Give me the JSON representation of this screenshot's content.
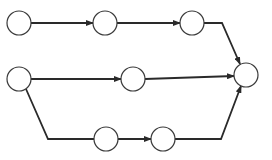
{
  "diagram": {
    "type": "network-graph",
    "colors": {
      "background": "#ffffff",
      "stroke": "#2a2a2a",
      "node_fill": "#ffffff"
    },
    "node_radius": 12,
    "nodes": [
      {
        "id": "n1",
        "x": 19,
        "y": 23
      },
      {
        "id": "n2",
        "x": 105,
        "y": 23
      },
      {
        "id": "n3",
        "x": 192,
        "y": 23
      },
      {
        "id": "n4",
        "x": 19,
        "y": 79
      },
      {
        "id": "n5",
        "x": 133,
        "y": 79
      },
      {
        "id": "n6",
        "x": 246,
        "y": 75
      },
      {
        "id": "n7",
        "x": 106,
        "y": 139
      },
      {
        "id": "n8",
        "x": 163,
        "y": 139
      }
    ],
    "edges": [
      {
        "from": "n1",
        "to": "n2",
        "path": "M31,23 L93,23",
        "arrow": true
      },
      {
        "from": "n2",
        "to": "n3",
        "path": "M117,23 L180,23",
        "arrow": true
      },
      {
        "from": "n3",
        "to": "n6",
        "path": "M204,23 L222,23 L240,64",
        "arrow": true
      },
      {
        "from": "n4",
        "to": "n5",
        "path": "M31,79 L121,79",
        "arrow": true
      },
      {
        "from": "n5",
        "to": "n6",
        "path": "M145,79 L234,76",
        "arrow": true
      },
      {
        "from": "n4",
        "to": "n7",
        "path": "M26,89 L48,139 L94,139",
        "arrow": false
      },
      {
        "from": "n7",
        "to": "n8",
        "path": "M118,139 L151,139",
        "arrow": true
      },
      {
        "from": "n8",
        "to": "n6",
        "path": "M175,139 L221,139 L241,86",
        "arrow": true
      }
    ]
  }
}
